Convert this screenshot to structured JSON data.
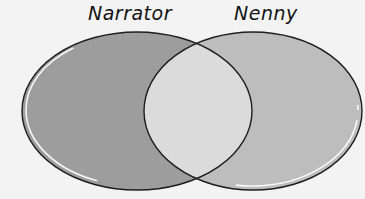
{
  "diagram": {
    "type": "venn",
    "sets": [
      {
        "label": "Narrator",
        "fill": "#9d9d9d",
        "cx": 137,
        "cy": 111,
        "rx": 115,
        "ry": 79
      },
      {
        "label": "Nenny",
        "fill": "#bdbdbd",
        "cx": 253,
        "cy": 111,
        "rx": 109,
        "ry": 79
      }
    ],
    "overlap_fill": "#dbdbdb",
    "stroke": "#1e1e1e",
    "highlight": "#ffffff",
    "background": "#f3f3f3"
  }
}
